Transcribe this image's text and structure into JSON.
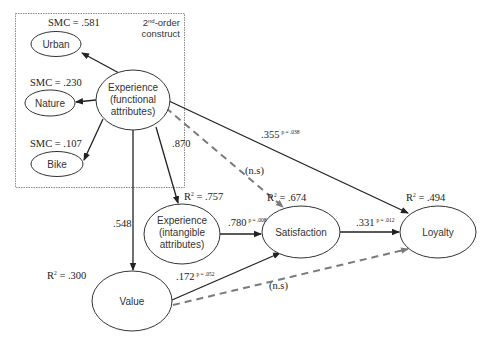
{
  "diagram": {
    "type": "structural-equation-model",
    "box_label": {
      "prefix": "2",
      "sup": "nd",
      "suffix": "-order",
      "line2": "construct"
    },
    "nodes": {
      "urban": {
        "label": "Urban",
        "smc": "SMC = .581"
      },
      "nature": {
        "label": "Nature",
        "smc": "SMC = .230"
      },
      "bike": {
        "label": "Bike",
        "smc": "SMC = .107"
      },
      "exp_func": {
        "line1": "Experience",
        "line2": "(functional",
        "line3": "attributes)"
      },
      "exp_intang": {
        "line1": "Experience",
        "line2": "(intangible",
        "line3": "attributes)",
        "r2_prefix": "R",
        "r2_sup": "2",
        "r2_value": " = .757"
      },
      "value": {
        "label": "Value",
        "r2_prefix": "R",
        "r2_sup": "2",
        "r2_value": " = .300"
      },
      "satisfaction": {
        "label": "Satisfaction",
        "r2_prefix": "R",
        "r2_sup": "2",
        "r2_value": " = .674"
      },
      "loyalty": {
        "label": "Loyalty",
        "r2_prefix": "R",
        "r2_sup": "2",
        "r2_value": " = .494"
      }
    },
    "paths": {
      "func_to_intang": {
        "coef": ".870"
      },
      "func_to_value": {
        "coef": ".548"
      },
      "func_to_loyalty": {
        "coef": ".355",
        "p": "p = .038"
      },
      "func_to_satisfaction": {
        "coef": "(n.s)"
      },
      "intang_to_satisfaction": {
        "coef": ".780",
        "p": "p = .008"
      },
      "satisfaction_to_loyalty": {
        "coef": ".331",
        "p": "p = .012"
      },
      "value_to_satisfaction": {
        "coef": ".172",
        "p": "p = .052"
      },
      "value_to_loyalty": {
        "coef": "(n.s)"
      }
    },
    "colors": {
      "line": "#222222",
      "dashed_line": "#7a7a7a",
      "box_border": "#888888",
      "node_border": "#333333"
    }
  }
}
